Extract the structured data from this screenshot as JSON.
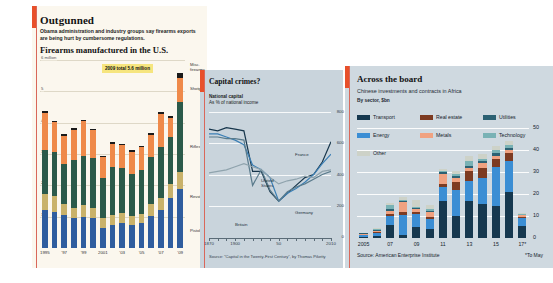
{
  "panels": {
    "outgunned": {
      "accent": "#e8502a",
      "background": "#fbf7ee",
      "title": "Outgunned",
      "deck": "Obama administration and industry groups say firearms exports are being hurt by cumbersome regulations.",
      "subtitle": "Firearms manufactured in the U.S.",
      "callout": "2009 total 5.6 million",
      "series_labels": [
        "Misc. firearms",
        "Shotguns",
        "Rifles",
        "Revolvers",
        "Pistols"
      ],
      "chart_data": {
        "type": "bar",
        "stacked": true,
        "title": "Firearms manufactured in the U.S.",
        "xlabel": "",
        "ylabel": "6 million",
        "ylim": [
          0,
          6
        ],
        "yticks": [
          1,
          2,
          3,
          4,
          5,
          6
        ],
        "ytick_labels": [
          "1",
          "2",
          "3",
          "4",
          "5",
          "6 million"
        ],
        "grid": true,
        "categories": [
          "1995",
          "1996",
          "1997",
          "1998",
          "1999",
          "2000",
          "2001",
          "2002",
          "2003",
          "2004",
          "2005",
          "2006",
          "2007",
          "2008",
          "2009"
        ],
        "xtick_labels": [
          "1995",
          "'97",
          "'99",
          "2001",
          "'03",
          "'05",
          "'07",
          "'09"
        ],
        "series": [
          {
            "name": "Pistols",
            "color": "#2f5d9e",
            "values": [
              1.2,
              1.15,
              1.05,
              0.95,
              0.99,
              0.96,
              0.63,
              0.74,
              0.81,
              0.73,
              0.8,
              1.02,
              1.22,
              1.61,
              1.87
            ]
          },
          {
            "name": "Revolvers",
            "color": "#c9b26a",
            "values": [
              0.53,
              0.5,
              0.37,
              0.33,
              0.38,
              0.32,
              0.32,
              0.32,
              0.31,
              0.29,
              0.27,
              0.39,
              0.39,
              0.43,
              0.55
            ]
          },
          {
            "name": "Rifles",
            "color": "#2b5a4a",
            "values": [
              1.41,
              1.43,
              1.25,
              1.54,
              1.57,
              1.58,
              1.28,
              1.52,
              1.43,
              1.33,
              1.43,
              1.5,
              1.61,
              1.49,
              2.25
            ]
          },
          {
            "name": "Shotguns",
            "color": "#ef8a4a",
            "values": [
              1.17,
              0.93,
              0.92,
              0.96,
              1.1,
              0.9,
              0.68,
              0.74,
              0.73,
              0.73,
              0.71,
              0.71,
              1.07,
              0.63,
              0.75
            ]
          },
          {
            "name": "Misc. firearms",
            "color": "#1a1a1a",
            "values": [
              0.06,
              0.05,
              0.05,
              0.05,
              0.06,
              0.05,
              0.04,
              0.05,
              0.04,
              0.04,
              0.05,
              0.06,
              0.06,
              0.07,
              0.18
            ]
          }
        ]
      }
    },
    "capital_crimes": {
      "accent": "#e8502a",
      "background": "#c9d4dc",
      "title": "Capital crimes?",
      "deck_line1": "National capital",
      "deck_line2": "As % of national income",
      "source": "Source: “Capital in the Twenty-First Century”, by Thomas Piketty",
      "annotations": [
        {
          "label": "France",
          "color": "#17364c"
        },
        {
          "label": "United States",
          "color": "#5a7b8c"
        },
        {
          "label": "Germany",
          "color": "#3b7fb5"
        },
        {
          "label": "Britain",
          "color": "#17364c"
        }
      ],
      "chart_data": {
        "type": "line",
        "title": "National capital",
        "xlabel": "",
        "ylabel": "As % of national income",
        "ylim": [
          0,
          800
        ],
        "yticks": [
          0,
          200,
          400,
          600,
          800
        ],
        "ytick_labels": [
          "0",
          "200",
          "400",
          "600",
          "800"
        ],
        "xlim": [
          1870,
          2010
        ],
        "xtick_labels": [
          "1870",
          "1900",
          "50",
          "2010"
        ],
        "xtick_values": [
          1870,
          1900,
          1950,
          2010
        ],
        "grid": true,
        "legend_position": "inline-annotations",
        "series": [
          {
            "name": "France",
            "color": "#17364c",
            "x": [
              1870,
              1880,
              1890,
              1900,
              1910,
              1920,
              1930,
              1940,
              1950,
              1960,
              1970,
              1980,
              1990,
              2000,
              2010
            ],
            "values": [
              690,
              680,
              700,
              690,
              680,
              420,
              420,
              290,
              230,
              280,
              330,
              380,
              400,
              480,
              610
            ]
          },
          {
            "name": "Britain",
            "color": "#3b7fb5",
            "x": [
              1870,
              1880,
              1890,
              1900,
              1910,
              1920,
              1930,
              1940,
              1950,
              1960,
              1970,
              1980,
              1990,
              2000,
              2010
            ],
            "values": [
              660,
              660,
              640,
              620,
              590,
              460,
              430,
              380,
              230,
              280,
              310,
              350,
              400,
              470,
              530
            ]
          },
          {
            "name": "Germany",
            "color": "#5a7b8c",
            "x": [
              1870,
              1880,
              1890,
              1900,
              1910,
              1920,
              1930,
              1940,
              1950,
              1960,
              1970,
              1980,
              1990,
              2000,
              2010
            ],
            "values": [
              640,
              640,
              630,
              630,
              620,
              330,
              430,
              300,
              230,
              290,
              320,
              340,
              370,
              400,
              420
            ]
          },
          {
            "name": "United States",
            "color": "#8fa3ad",
            "x": [
              1870,
              1880,
              1890,
              1900,
              1910,
              1920,
              1930,
              1940,
              1950,
              1960,
              1970,
              1980,
              1990,
              2000,
              2010
            ],
            "values": [
              410,
              420,
              430,
              450,
              470,
              450,
              430,
              380,
              340,
              360,
              370,
              390,
              380,
              420,
              430
            ]
          }
        ]
      }
    },
    "across_the_board": {
      "accent": "#e8502a",
      "background": "#cfd9e0",
      "title": "Across the board",
      "deck": "Chinese investments and contracts in Africa",
      "unit": "By sector, $bn",
      "source": "Source: American Enterprise Institute",
      "note": "*To May",
      "legend": [
        {
          "label": "Transport",
          "color": "#16384f"
        },
        {
          "label": "Real estate",
          "color": "#7d3b22"
        },
        {
          "label": "Utilities",
          "color": "#2c6173"
        },
        {
          "label": "Energy",
          "color": "#3b8ed4"
        },
        {
          "label": "Metals",
          "color": "#f0a281"
        },
        {
          "label": "Technology",
          "color": "#79b2b5"
        },
        {
          "label": "Other",
          "color": "#cdd2c8"
        }
      ],
      "chart_data": {
        "type": "bar",
        "stacked": true,
        "title": "Chinese investments and contracts in Africa",
        "xlabel": "",
        "ylabel": "By sector, $bn",
        "ylim": [
          0,
          50
        ],
        "yticks": [
          0,
          10,
          20,
          30,
          40,
          50
        ],
        "ytick_labels": [
          "0",
          "10",
          "20",
          "30",
          "40",
          "50"
        ],
        "grid": true,
        "categories": [
          "2005",
          "06",
          "07",
          "08",
          "09",
          "10",
          "11",
          "12",
          "13",
          "14",
          "15",
          "16",
          "17*"
        ],
        "xtick_labels": [
          "2005",
          "07",
          "09",
          "11",
          "13",
          "15",
          "17*"
        ],
        "xtick_indices": [
          0,
          2,
          4,
          6,
          8,
          10,
          12
        ],
        "series": [
          {
            "name": "Transport",
            "color": "#16384f",
            "values": [
              0.6,
              1.0,
              6.0,
              1.5,
              5.0,
              4.0,
              17.0,
              10.0,
              17.0,
              15.5,
              14.5,
              21.0,
              5.5
            ]
          },
          {
            "name": "Energy",
            "color": "#3b8ed4",
            "values": [
              0.8,
              1.5,
              4.0,
              9.0,
              6.0,
              4.5,
              6.0,
              12.0,
              9.0,
              12.0,
              18.0,
              14.0,
              3.5
            ]
          },
          {
            "name": "Real estate",
            "color": "#7d3b22",
            "values": [
              0.2,
              0.4,
              1.0,
              1.5,
              1.0,
              1.0,
              1.5,
              3.5,
              4.5,
              4.5,
              3.5,
              3.5,
              0.5
            ]
          },
          {
            "name": "Metals",
            "color": "#f0a281",
            "values": [
              0.3,
              0.5,
              1.5,
              4.5,
              1.0,
              2.5,
              4.5,
              2.0,
              1.5,
              2.0,
              1.5,
              1.5,
              0.8
            ]
          },
          {
            "name": "Utilities",
            "color": "#2c6173",
            "values": [
              0.2,
              0.3,
              0.8,
              0.5,
              0.5,
              0.5,
              0.8,
              0.8,
              0.8,
              1.0,
              1.0,
              1.0,
              0.3
            ]
          },
          {
            "name": "Technology",
            "color": "#79b2b5",
            "values": [
              0.2,
              0.3,
              1.5,
              0.5,
              0.5,
              0.5,
              0.5,
              0.8,
              2.0,
              1.0,
              1.5,
              1.5,
              0.2
            ]
          },
          {
            "name": "Other",
            "color": "#cdd2c8",
            "values": [
              0.2,
              0.5,
              1.0,
              1.0,
              3.5,
              2.0,
              1.0,
              1.5,
              2.5,
              2.0,
              2.0,
              1.5,
              0.4
            ]
          }
        ]
      }
    }
  }
}
